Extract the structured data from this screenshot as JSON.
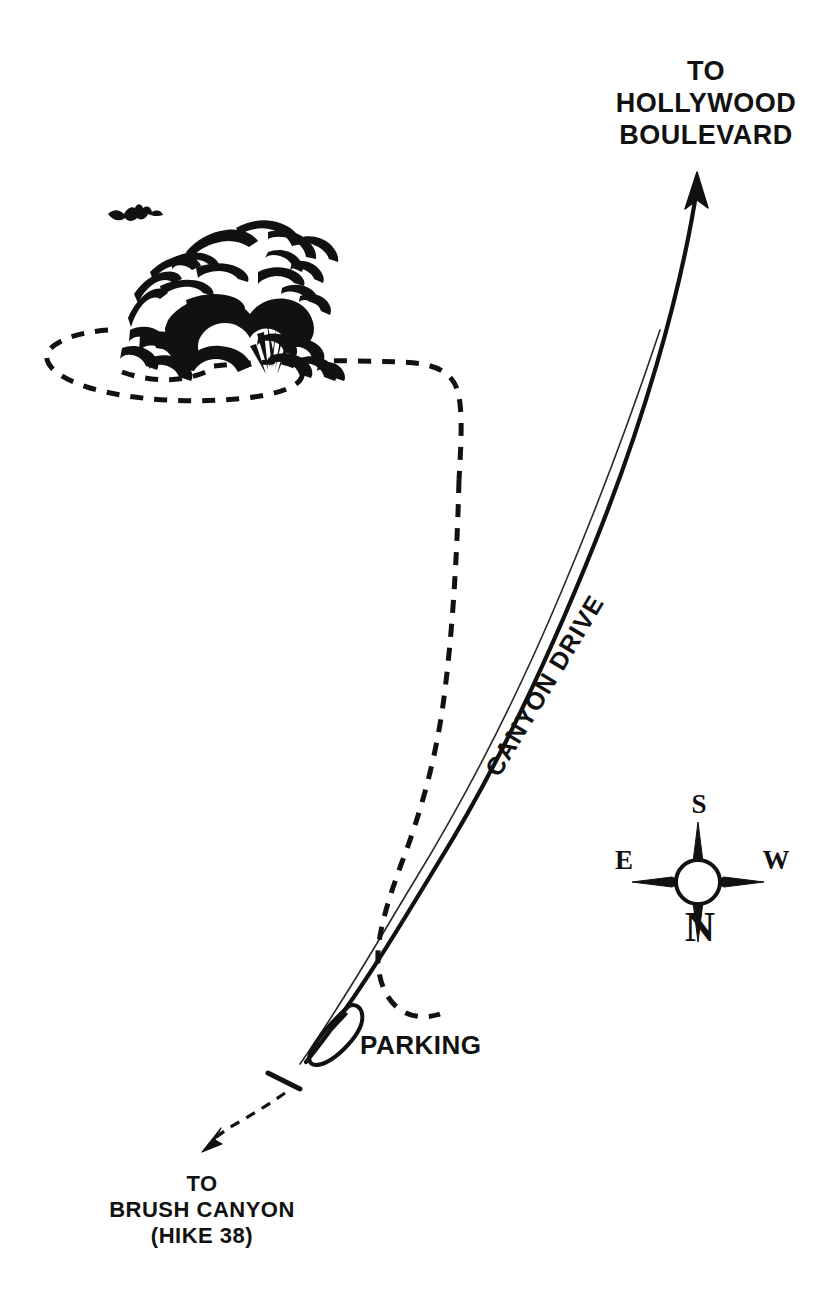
{
  "map": {
    "title": "Bronson Caves Trail Map",
    "background_color": "#ffffff",
    "ink_color": "#111111",
    "labels": {
      "destination_north": "TO\nHOLLYWOOD\nBOULEVARD",
      "destination_south": "TO\nBRUSH CANYON\n(HIKE 38)",
      "road_name": "CANYON DRIVE",
      "parking": "PARKING"
    },
    "compass": {
      "north": "N",
      "south": "S",
      "east": "E",
      "west": "W"
    },
    "features": [
      {
        "name": "canyon-drive-road",
        "type": "road",
        "style": "solid"
      },
      {
        "name": "bronson-caves-trail",
        "type": "trail",
        "style": "dashed"
      },
      {
        "name": "brush-canyon-spur-trail",
        "type": "trail",
        "style": "dashed"
      },
      {
        "name": "parking-loop",
        "type": "parking",
        "style": "solid"
      },
      {
        "name": "trail-gate",
        "type": "gate",
        "style": "solid"
      },
      {
        "name": "rock-outcrop",
        "type": "landmark",
        "style": "illustration"
      },
      {
        "name": "cave-entrance",
        "type": "landmark",
        "style": "illustration"
      },
      {
        "name": "bat",
        "type": "wildlife",
        "style": "illustration"
      }
    ]
  }
}
